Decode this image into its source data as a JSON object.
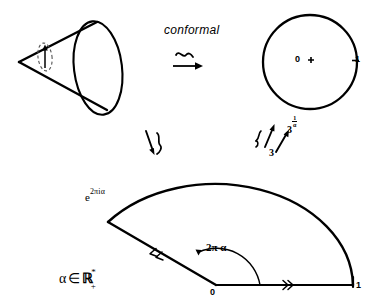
{
  "figure": {
    "background_color": "#ffffff",
    "stroke_color": "#000000"
  },
  "top_row": {
    "cone": {
      "name": "cone",
      "apex_marker": "small dashed ellipse with upward arrow",
      "description": "cone with elliptical base drawn in perspective"
    },
    "arrow": {
      "label": "conformal",
      "symbol": "≃→",
      "symbol_name": "tilde-over-arrow"
    },
    "disk": {
      "name": "unit disk",
      "center_label": "0",
      "center_marker": "+",
      "boundary_label": "1",
      "boundary_tick": true
    }
  },
  "vertical_maps": {
    "left": {
      "symbol": "≀",
      "symbol_name": "wreath-isomorphism-arrow"
    },
    "right": {
      "symbol": "≀",
      "symbol_name": "wreath-isomorphism-arrow",
      "from_label": "3",
      "to_label_base": "3",
      "to_label_exponent_numerator": "1",
      "to_label_exponent_denominator": "α"
    }
  },
  "sector": {
    "name": "circular sector",
    "vertex_label": "0",
    "radius_label": "1",
    "arc_endpoint_label_base": "e",
    "arc_endpoint_label_exponent": "2πiα",
    "angle_label": "2π α",
    "angle_degrees": 150,
    "condition_label_alpha": "α",
    "condition_label_in": "∈",
    "condition_label_set": "ℝ",
    "condition_label_star": "*",
    "condition_label_plus": "+",
    "orientation_markers": [
      "double-tick on bottom radius",
      "double-tick on slanted radius"
    ]
  }
}
